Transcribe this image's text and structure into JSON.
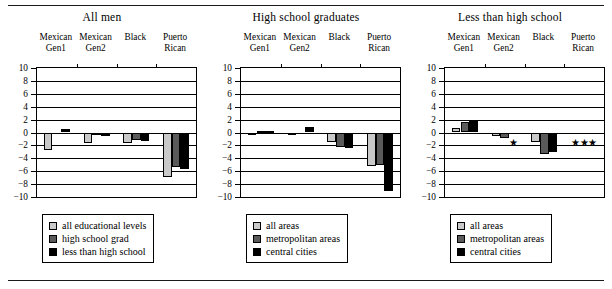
{
  "figure": {
    "has_top_rule": true,
    "has_bottom_rule": true,
    "star_marker": "★",
    "star_note": "asterisk marks suppressed or unavailable estimate"
  },
  "chart_data": [
    {
      "type": "bar",
      "title": "All men",
      "xlabel": "",
      "ylabel": "",
      "ylim": [
        -10,
        10
      ],
      "yticks": [
        10,
        8,
        6,
        4,
        2,
        0,
        -2,
        -4,
        -6,
        -8,
        -10
      ],
      "ytick_labels": [
        "10",
        "8",
        "6",
        "4",
        "2",
        "0",
        "−2",
        "−4",
        "−6",
        "−8",
        "−10"
      ],
      "grid": true,
      "legend_position": "below",
      "categories": [
        "Mexican Gen1",
        "Mexican Gen2",
        "Black",
        "Puerto Rican"
      ],
      "category_lines": [
        [
          "Mexican",
          "Gen1"
        ],
        [
          "Mexican",
          "Gen2"
        ],
        [
          "",
          "Black"
        ],
        [
          "Puerto",
          "Rican"
        ]
      ],
      "series": [
        {
          "name": "all educational levels",
          "color": "#c9c9c9",
          "values": [
            -2.7,
            -1.6,
            -1.7,
            -6.9
          ]
        },
        {
          "name": "high school grad",
          "color": "#5a5a5a",
          "values": [
            null,
            -0.2,
            -1.2,
            -5.4
          ]
        },
        {
          "name": "less than high school",
          "color": "#000000",
          "values": [
            0.5,
            -0.5,
            -1.3,
            -5.6
          ]
        }
      ],
      "stars": []
    },
    {
      "type": "bar",
      "title": "High school graduates",
      "xlabel": "",
      "ylabel": "",
      "ylim": [
        -10,
        10
      ],
      "yticks": [
        10,
        8,
        6,
        4,
        2,
        0,
        -2,
        -4,
        -6,
        -8,
        -10
      ],
      "ytick_labels": [
        "10",
        "8",
        "6",
        "4",
        "2",
        "0",
        "−2",
        "−4",
        "−6",
        "−8",
        "−10"
      ],
      "grid": true,
      "legend_position": "below",
      "categories": [
        "Mexican Gen1",
        "Mexican Gen2",
        "Black",
        "Puerto Rican"
      ],
      "category_lines": [
        [
          "Mexican",
          "Gen1"
        ],
        [
          "Mexican",
          "Gen2"
        ],
        [
          "",
          "Black"
        ],
        [
          "Puerto",
          "Rican"
        ]
      ],
      "series": [
        {
          "name": "all areas",
          "color": "#c9c9c9",
          "values": [
            -0.2,
            -0.1,
            -1.5,
            -5.2
          ]
        },
        {
          "name": "metropolitan areas",
          "color": "#5a5a5a",
          "values": [
            0.3,
            null,
            -2.2,
            -5.0
          ]
        },
        {
          "name": "central cities",
          "color": "#000000",
          "values": [
            0.2,
            0.9,
            -2.4,
            -9.1
          ]
        }
      ],
      "stars": []
    },
    {
      "type": "bar",
      "title": "Less than high school",
      "xlabel": "",
      "ylabel": "",
      "ylim": [
        -10,
        10
      ],
      "yticks": [
        10,
        8,
        6,
        4,
        2,
        0,
        -2,
        -4,
        -6,
        -8,
        -10
      ],
      "ytick_labels": [
        "10",
        "8",
        "6",
        "4",
        "2",
        "0",
        "−2",
        "−4",
        "−6",
        "−8",
        "−10"
      ],
      "grid": true,
      "legend_position": "below",
      "categories": [
        "Mexican Gen1",
        "Mexican Gen2",
        "Black",
        "Puerto Rican"
      ],
      "category_lines": [
        [
          "Mexican",
          "Gen1"
        ],
        [
          "Mexican",
          "Gen2"
        ],
        [
          "",
          "Black"
        ],
        [
          "Puerto",
          "Rican"
        ]
      ],
      "series": [
        {
          "name": "all areas",
          "color": "#c9c9c9",
          "values": [
            0.7,
            -0.6,
            -1.4,
            null
          ]
        },
        {
          "name": "metropolitan areas",
          "color": "#5a5a5a",
          "values": [
            1.6,
            -0.8,
            -3.4,
            null
          ]
        },
        {
          "name": "central cities",
          "color": "#000000",
          "values": [
            1.9,
            null,
            -3.1,
            null
          ]
        }
      ],
      "stars": [
        {
          "category": "Mexican Gen2",
          "series_index": 2,
          "y": -1.7
        },
        {
          "category": "Puerto Rican",
          "series_index": 0,
          "y": -1.7
        },
        {
          "category": "Puerto Rican",
          "series_index": 1,
          "y": -1.7
        },
        {
          "category": "Puerto Rican",
          "series_index": 2,
          "y": -1.7
        }
      ]
    }
  ]
}
